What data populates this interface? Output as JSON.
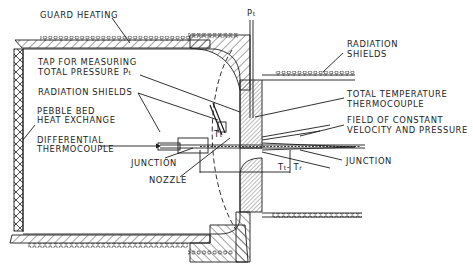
{
  "diagram": {
    "type": "technical cross-section",
    "labels": {
      "guard_heating": "GUARD HEATING",
      "tap_line1": "TAP FOR MEASURING",
      "tap_line2": "TOTAL PRESSURE P",
      "tap_sub": "t",
      "radiation_shields_left": "RADIATION SHIELDS",
      "pebble_line1": "PEBBLE BED",
      "pebble_line2": "HEAT EXCHANGE",
      "diff_line1": "DIFFERENTIAL",
      "diff_line2": "THERMOCOUPLE",
      "junction_left": "JUNCTION",
      "nozzle": "NOZZLE",
      "pt_main": "P",
      "pt_sub": "t",
      "radiation_shields_right_line1": "RADIATION",
      "radiation_shields_right_line2": "SHIELDS",
      "total_temp_line1": "TOTAL TEMPERATURE",
      "total_temp_line2": "THERMOCOUPLE",
      "field_line1": "FIELD OF CONSTANT",
      "field_line2": "VELOCITY AND PRESSURE",
      "junction_right": "JUNCTION",
      "tt_main": "T",
      "tt_sub": "t",
      "delta_t": "T",
      "delta_t_sub1": "t",
      "delta_t_mid": "- T",
      "delta_t_sub2": "r"
    },
    "colors": {
      "ink": "#1c1c1c",
      "background": "#ffffff"
    }
  }
}
